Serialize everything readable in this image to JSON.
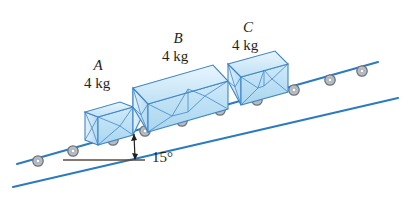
{
  "figure": {
    "background_color": "#ffffff",
    "incline": {
      "angle_label": "15°",
      "angle_value": 15,
      "line_color": "#2b7bc0",
      "surface_name": "inclined-rail",
      "top_line": {
        "x1": 17,
        "y1": 164,
        "x2": 378,
        "y2": 62
      },
      "bottom_line": {
        "x1": 13,
        "y1": 187,
        "x2": 398,
        "y2": 98
      }
    },
    "reference_line": {
      "name": "horizontal-reference-line",
      "color": "#5c4b3c",
      "x1": 63,
      "y1": 160,
      "x2": 145,
      "y2": 160
    },
    "angle_arrow": {
      "name": "angle-double-arrow",
      "color": "#231f20"
    },
    "roller": {
      "fill": "#b9bdc4",
      "stroke": "#6f747c",
      "radius": 5.2
    },
    "rollers": [
      {
        "cx": 38,
        "cy": 161
      },
      {
        "cx": 73,
        "cy": 151
      },
      {
        "cx": 113,
        "cy": 140
      },
      {
        "cx": 145,
        "cy": 131
      },
      {
        "cx": 182,
        "cy": 121
      },
      {
        "cx": 220,
        "cy": 110
      },
      {
        "cx": 257,
        "cy": 100
      },
      {
        "cx": 294,
        "cy": 90
      },
      {
        "cx": 330,
        "cy": 80
      },
      {
        "cx": 362,
        "cy": 71
      }
    ],
    "blocks": [
      {
        "id": "A",
        "name": "block-a",
        "letter": "A",
        "mass": "4 kg",
        "letter_pos": {
          "x": 98,
          "y": 70
        },
        "mass_pos": {
          "x": 97,
          "y": 88
        },
        "fill_light": "#dbeefb",
        "fill_mid": "#b6dcf2",
        "stroke": "#3f86c6"
      },
      {
        "id": "B",
        "name": "block-b",
        "letter": "B",
        "mass": "4 kg",
        "letter_pos": {
          "x": 178,
          "y": 43
        },
        "mass_pos": {
          "x": 175,
          "y": 61
        },
        "fill_light": "#dbeefb",
        "fill_mid": "#b6dcf2",
        "stroke": "#3f86c6"
      },
      {
        "id": "C",
        "name": "block-c",
        "letter": "C",
        "mass": "4 kg",
        "letter_pos": {
          "x": 248,
          "y": 32
        },
        "mass_pos": {
          "x": 245,
          "y": 50
        },
        "fill_light": "#dbeefb",
        "fill_mid": "#b6dcf2",
        "stroke": "#3f86c6"
      }
    ],
    "labels": {
      "block_a_letter": "A",
      "block_a_mass": "4 kg",
      "block_b_letter": "B",
      "block_b_mass": "4 kg",
      "block_c_letter": "C",
      "block_c_mass": "4 kg",
      "angle": "15°"
    }
  }
}
